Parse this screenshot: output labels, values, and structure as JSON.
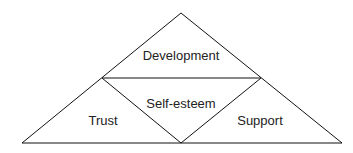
{
  "diagram": {
    "title": "",
    "regions": [
      {
        "id": "top",
        "label": "Development"
      },
      {
        "id": "center",
        "label": "Self-esteem"
      },
      {
        "id": "left",
        "label": "Trust"
      },
      {
        "id": "right",
        "label": "Support"
      }
    ],
    "stroke_color": "#111111"
  }
}
